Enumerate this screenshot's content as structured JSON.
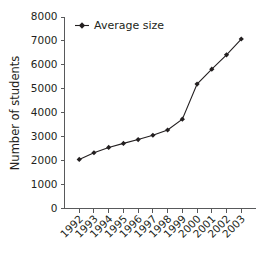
{
  "chart_data": {
    "type": "line",
    "title": "",
    "subtitle": "",
    "xlabel": "",
    "ylabel": "Number of students",
    "categories": [
      "1992",
      "1993",
      "1994",
      "1995",
      "1996",
      "1997",
      "1998",
      "1999",
      "2000",
      "2001",
      "2002",
      "2003"
    ],
    "series": [
      {
        "name": "Average size",
        "values": [
          2050,
          2330,
          2550,
          2720,
          2880,
          3060,
          3280,
          3730,
          5200,
          5820,
          6420,
          7080
        ],
        "color": "#231f20",
        "marker": "diamond"
      }
    ],
    "ylim": [
      0,
      8000
    ],
    "ytick_values": [
      0,
      1000,
      2000,
      3000,
      4000,
      5000,
      6000,
      7000,
      8000
    ],
    "ytick_labels": [
      "0",
      "1000",
      "2000",
      "3000",
      "4000",
      "5000",
      "6000",
      "7000",
      "8000"
    ],
    "xtick_labels": [
      "1992",
      "1993",
      "1994",
      "1995",
      "1996",
      "1997",
      "1998",
      "1999",
      "2000",
      "2001",
      "2002",
      "2003"
    ],
    "xtick_rotation": -45,
    "grid": false,
    "legend": {
      "position": "top-left-inside",
      "entries": [
        "Average size"
      ]
    },
    "axis_color": "#58595b",
    "background_color": "#ffffff"
  },
  "legend": {
    "entry_label": "Average size"
  },
  "axis": {
    "y_title": "Number of students"
  }
}
